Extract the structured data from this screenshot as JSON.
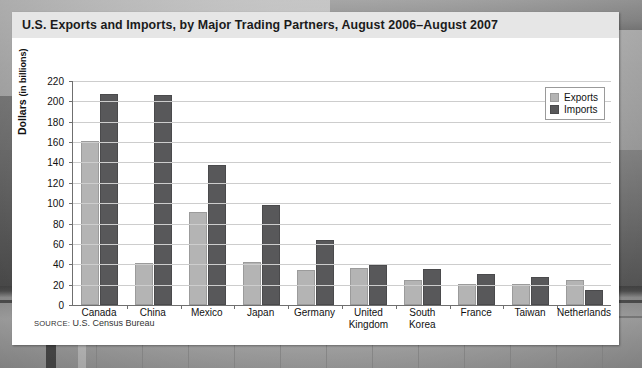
{
  "card": {
    "title": "U.S. Exports and Imports, by Major Trading Partners, August 2006–August 2007",
    "source_prefix": "SOURCE:",
    "source_text": "U.S. Census Bureau"
  },
  "axis": {
    "ylabel_main": "Dollars",
    "ylabel_sub": "(in billions)",
    "yticks": [
      "220",
      "200",
      "180",
      "160",
      "140",
      "120",
      "100",
      "80",
      "60",
      "40",
      "20",
      "0"
    ]
  },
  "legend": {
    "exports": "Exports",
    "imports": "Imports"
  },
  "colors": {
    "exports": "#b4b4b4",
    "imports": "#58585a",
    "title_band": "#e6e6e6",
    "grid": "#cdcdcd",
    "axis": "#6f6f6f"
  },
  "chart_data": {
    "type": "bar",
    "title": "U.S. Exports and Imports, by Major Trading Partners, August 2006–August 2007",
    "xlabel": "",
    "ylabel": "Dollars (in billions)",
    "ylim": [
      0,
      220
    ],
    "ytick_step": 20,
    "grid": true,
    "legend_position": "top-right",
    "categories": [
      "Canada",
      "China",
      "Mexico",
      "Japan",
      "Germany",
      "United Kingdom",
      "South Korea",
      "France",
      "Taiwan",
      "Netherlands"
    ],
    "series": [
      {
        "name": "Exports",
        "values": [
          161,
          41,
          91,
          42,
          34,
          36,
          25,
          21,
          21,
          25
        ]
      },
      {
        "name": "Imports",
        "values": [
          207,
          206,
          138,
          98,
          64,
          39,
          35,
          30,
          28,
          15
        ]
      }
    ],
    "annotations": [
      "SOURCE: U.S. Census Bureau"
    ]
  }
}
